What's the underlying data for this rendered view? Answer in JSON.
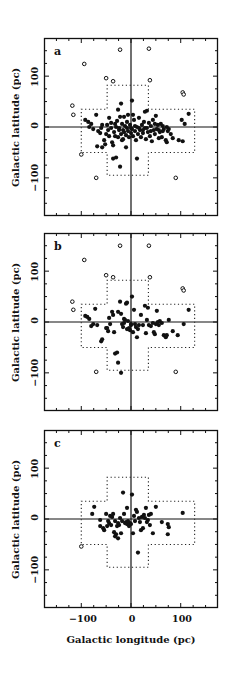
{
  "figure": {
    "ylabel": "Galactic latitude (pc)",
    "xlabel": "Galactic longitude (pc)",
    "y_ticks": [
      "100",
      "0",
      "−100"
    ],
    "x_ticks": [
      "−100",
      "0",
      "100"
    ]
  },
  "chart_data": [
    {
      "type": "scatter",
      "panel_label": "a",
      "xlabel": "",
      "ylabel": "Galactic latitude (pc)",
      "xlim": [
        -175,
        175
      ],
      "ylim": [
        -175,
        175
      ],
      "grid": false,
      "reference_lines": {
        "x": 0,
        "y": 0
      },
      "outline": "dotted cross: horizontal box x[-100,128] y[-50,35]; vertical box x[-48,35] y[-95,82]",
      "series": [
        {
          "name": "open circles",
          "marker": "open",
          "points": [
            [
              -22,
              152
            ],
            [
              36,
              154
            ],
            [
              -94,
              124
            ],
            [
              -50,
              96
            ],
            [
              -36,
              90
            ],
            [
              38,
              92
            ],
            [
              104,
              68
            ],
            [
              106,
              64
            ],
            [
              -118,
              42
            ],
            [
              -116,
              24
            ],
            [
              -100,
              -54
            ],
            [
              -70,
              -100
            ],
            [
              90,
              -100
            ]
          ]
        },
        {
          "name": "filled circles",
          "marker": "filled",
          "points": [
            [
              -92,
              14
            ],
            [
              -86,
              10
            ],
            [
              -80,
              6
            ],
            [
              -76,
              -4
            ],
            [
              -70,
              24
            ],
            [
              -66,
              -8
            ],
            [
              -62,
              -12
            ],
            [
              -58,
              4
            ],
            [
              -54,
              -26
            ],
            [
              -50,
              -14
            ],
            [
              -46,
              -6
            ],
            [
              -44,
              -18
            ],
            [
              -40,
              8
            ],
            [
              -38,
              -30
            ],
            [
              -36,
              -36
            ],
            [
              -34,
              -10
            ],
            [
              -32,
              -18
            ],
            [
              -30,
              0
            ],
            [
              -28,
              12
            ],
            [
              -26,
              -20
            ],
            [
              -24,
              -6
            ],
            [
              -22,
              20
            ],
            [
              -20,
              -14
            ],
            [
              -18,
              6
            ],
            [
              -16,
              -24
            ],
            [
              -14,
              -10
            ],
            [
              -12,
              2
            ],
            [
              -10,
              -16
            ],
            [
              -8,
              10
            ],
            [
              -6,
              -8
            ],
            [
              -4,
              -20
            ],
            [
              -2,
              4
            ],
            [
              0,
              -12
            ],
            [
              2,
              -4
            ],
            [
              4,
              -18
            ],
            [
              6,
              14
            ],
            [
              8,
              -8
            ],
            [
              10,
              -26
            ],
            [
              12,
              0
            ],
            [
              14,
              -14
            ],
            [
              16,
              18
            ],
            [
              18,
              -6
            ],
            [
              20,
              -20
            ],
            [
              22,
              4
            ],
            [
              24,
              -12
            ],
            [
              26,
              10
            ],
            [
              28,
              -2
            ],
            [
              30,
              -24
            ],
            [
              32,
              32
            ],
            [
              34,
              -10
            ],
            [
              36,
              8
            ],
            [
              38,
              -18
            ],
            [
              40,
              2
            ],
            [
              42,
              -28
            ],
            [
              44,
              14
            ],
            [
              46,
              -6
            ],
            [
              48,
              -14
            ],
            [
              50,
              22
            ],
            [
              52,
              -4
            ],
            [
              54,
              4
            ],
            [
              56,
              -22
            ],
            [
              58,
              -10
            ],
            [
              60,
              6
            ],
            [
              62,
              -20
            ],
            [
              64,
              2
            ],
            [
              66,
              -4
            ],
            [
              70,
              -26
            ],
            [
              72,
              -30
            ],
            [
              74,
              -8
            ],
            [
              76,
              -4
            ],
            [
              80,
              -14
            ],
            [
              84,
              -22
            ],
            [
              -68,
              -38
            ],
            [
              -58,
              -40
            ],
            [
              -52,
              -34
            ],
            [
              -36,
              -62
            ],
            [
              -30,
              -60
            ],
            [
              -22,
              -78
            ],
            [
              -18,
              -26
            ],
            [
              -10,
              -40
            ],
            [
              -6,
              24
            ],
            [
              2,
              52
            ],
            [
              4,
              24
            ],
            [
              -26,
              34
            ],
            [
              -20,
              46
            ],
            [
              12,
              -62
            ],
            [
              -44,
              18
            ],
            [
              -14,
              20
            ],
            [
              28,
              30
            ],
            [
              102,
              14
            ],
            [
              108,
              6
            ],
            [
              116,
              26
            ],
            [
              104,
              -28
            ],
            [
              96,
              -26
            ],
            [
              -84,
              0
            ],
            [
              -60,
              -2
            ],
            [
              -48,
              4
            ],
            [
              -40,
              -2
            ],
            [
              -32,
              6
            ],
            [
              -24,
              -2
            ],
            [
              -16,
              -6
            ],
            [
              -8,
              -2
            ],
            [
              0,
              -2
            ],
            [
              8,
              2
            ],
            [
              16,
              -2
            ],
            [
              24,
              -6
            ],
            [
              32,
              -2
            ],
            [
              40,
              -8
            ],
            [
              48,
              6
            ],
            [
              56,
              -6
            ],
            [
              64,
              -8
            ],
            [
              72,
              0
            ]
          ]
        }
      ]
    },
    {
      "type": "scatter",
      "panel_label": "b",
      "xlabel": "",
      "ylabel": "Galactic latitude (pc)",
      "xlim": [
        -175,
        175
      ],
      "ylim": [
        -175,
        175
      ],
      "grid": false,
      "reference_lines": {
        "x": 0,
        "y": 0
      },
      "outline": "dotted cross: horizontal box x[-100,128] y[-50,35]; vertical box x[-48,35] y[-95,82]",
      "series": [
        {
          "name": "open circles",
          "marker": "open",
          "points": [
            [
              -22,
              150
            ],
            [
              36,
              150
            ],
            [
              -94,
              122
            ],
            [
              -50,
              92
            ],
            [
              -36,
              88
            ],
            [
              38,
              88
            ],
            [
              104,
              66
            ],
            [
              106,
              62
            ],
            [
              -118,
              40
            ],
            [
              -116,
              24
            ],
            [
              -70,
              -98
            ],
            [
              90,
              -98
            ]
          ]
        },
        {
          "name": "filled circles",
          "marker": "filled",
          "points": [
            [
              -92,
              12
            ],
            [
              -88,
              10
            ],
            [
              -84,
              6
            ],
            [
              -80,
              -8
            ],
            [
              -76,
              -4
            ],
            [
              -72,
              26
            ],
            [
              -68,
              -6
            ],
            [
              -60,
              -38
            ],
            [
              -58,
              -34
            ],
            [
              -50,
              -12
            ],
            [
              -46,
              -18
            ],
            [
              -42,
              -4
            ],
            [
              -38,
              20
            ],
            [
              -36,
              14
            ],
            [
              -34,
              -20
            ],
            [
              -32,
              -62
            ],
            [
              -28,
              -60
            ],
            [
              -26,
              20
            ],
            [
              -22,
              40
            ],
            [
              -20,
              16
            ],
            [
              -18,
              -4
            ],
            [
              -16,
              -10
            ],
            [
              -14,
              -2
            ],
            [
              -12,
              4
            ],
            [
              -10,
              36
            ],
            [
              -8,
              -14
            ],
            [
              -6,
              2
            ],
            [
              -4,
              -12
            ],
            [
              -2,
              -16
            ],
            [
              0,
              -6
            ],
            [
              2,
              50
            ],
            [
              4,
              -20
            ],
            [
              6,
              24
            ],
            [
              8,
              -4
            ],
            [
              10,
              -10
            ],
            [
              12,
              -30
            ],
            [
              14,
              -14
            ],
            [
              16,
              -6
            ],
            [
              20,
              14
            ],
            [
              24,
              -6
            ],
            [
              28,
              32
            ],
            [
              30,
              -22
            ],
            [
              32,
              4
            ],
            [
              36,
              -6
            ],
            [
              40,
              -8
            ],
            [
              44,
              -2
            ],
            [
              46,
              -20
            ],
            [
              48,
              -24
            ],
            [
              50,
              -4
            ],
            [
              52,
              22
            ],
            [
              54,
              0
            ],
            [
              56,
              -6
            ],
            [
              58,
              2
            ],
            [
              62,
              -2
            ],
            [
              66,
              -26
            ],
            [
              70,
              -30
            ],
            [
              72,
              -26
            ],
            [
              76,
              4
            ],
            [
              84,
              -18
            ],
            [
              94,
              -26
            ],
            [
              106,
              -4
            ],
            [
              116,
              24
            ],
            [
              -26,
              -80
            ],
            [
              -20,
              -100
            ],
            [
              -14,
              6
            ],
            [
              0,
              -4
            ],
            [
              -8,
              38
            ],
            [
              34,
              28
            ],
            [
              -44,
              8
            ],
            [
              -48,
              -12
            ]
          ]
        }
      ]
    },
    {
      "type": "scatter",
      "panel_label": "c",
      "xlabel": "Galactic longitude (pc)",
      "ylabel": "Galactic latitude (pc)",
      "xlim": [
        -175,
        175
      ],
      "ylim": [
        -175,
        175
      ],
      "x_ticks": [
        -100,
        0,
        100
      ],
      "y_ticks": [
        -100,
        0,
        100
      ],
      "grid": false,
      "reference_lines": {
        "x": 0,
        "y": 0
      },
      "outline": "dotted cross: horizontal box x[-100,128] y[-50,35]; vertical box x[-48,35] y[-95,82]",
      "series": [
        {
          "name": "open circles",
          "marker": "open",
          "points": [
            [
              -100,
              -54
            ]
          ]
        },
        {
          "name": "filled circles",
          "marker": "filled",
          "points": [
            [
              -74,
              24
            ],
            [
              -78,
              10
            ],
            [
              -62,
              -2
            ],
            [
              -62,
              -14
            ],
            [
              -56,
              -18
            ],
            [
              -54,
              -22
            ],
            [
              -50,
              10
            ],
            [
              -48,
              -14
            ],
            [
              -46,
              -4
            ],
            [
              -44,
              -8
            ],
            [
              -42,
              6
            ],
            [
              -40,
              -12
            ],
            [
              -38,
              4
            ],
            [
              -36,
              10
            ],
            [
              -34,
              -26
            ],
            [
              -32,
              -4
            ],
            [
              -30,
              -30
            ],
            [
              -28,
              -14
            ],
            [
              -26,
              -8
            ],
            [
              -24,
              -12
            ],
            [
              -22,
              2
            ],
            [
              -20,
              -28
            ],
            [
              -18,
              -4
            ],
            [
              -16,
              52
            ],
            [
              -14,
              10
            ],
            [
              -12,
              -8
            ],
            [
              -10,
              -6
            ],
            [
              -8,
              -10
            ],
            [
              -6,
              -4
            ],
            [
              -4,
              -14
            ],
            [
              -2,
              -8
            ],
            [
              0,
              -10
            ],
            [
              2,
              48
            ],
            [
              4,
              -28
            ],
            [
              6,
              6
            ],
            [
              8,
              -4
            ],
            [
              10,
              18
            ],
            [
              12,
              14
            ],
            [
              14,
              -66
            ],
            [
              16,
              2
            ],
            [
              18,
              -6
            ],
            [
              20,
              -22
            ],
            [
              22,
              4
            ],
            [
              24,
              -18
            ],
            [
              26,
              8
            ],
            [
              28,
              2
            ],
            [
              30,
              22
            ],
            [
              32,
              -6
            ],
            [
              34,
              -2
            ],
            [
              36,
              8
            ],
            [
              38,
              -12
            ],
            [
              40,
              10
            ],
            [
              44,
              -28
            ],
            [
              50,
              24
            ],
            [
              62,
              -6
            ],
            [
              74,
              -10
            ],
            [
              76,
              -16
            ],
            [
              74,
              -30
            ],
            [
              104,
              12
            ],
            [
              -26,
              -38
            ],
            [
              -32,
              -34
            ],
            [
              -8,
              22
            ]
          ]
        }
      ]
    }
  ]
}
